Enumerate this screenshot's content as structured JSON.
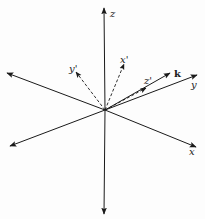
{
  "diagram": {
    "type": "3d-coordinate-axes-rotation",
    "origin": [
      105,
      110
    ],
    "axes": [
      {
        "id": "z",
        "label": "z",
        "end": [
          104,
          8
        ],
        "style": "solid",
        "label_pos": [
          110,
          17
        ]
      },
      {
        "id": "z-neg",
        "label": "",
        "end": [
          104,
          214
        ],
        "style": "solid"
      },
      {
        "id": "y",
        "label": "y",
        "end": [
          197,
          75
        ],
        "style": "solid",
        "label_pos": [
          191,
          88
        ]
      },
      {
        "id": "y-neg",
        "label": "",
        "end": [
          10,
          146
        ],
        "style": "solid"
      },
      {
        "id": "x",
        "label": "x",
        "end": [
          196,
          147
        ],
        "style": "solid",
        "label_pos": [
          189,
          155
        ]
      },
      {
        "id": "x-neg",
        "label": "",
        "end": [
          7,
          73
        ],
        "style": "solid"
      },
      {
        "id": "k",
        "label": "k",
        "end": [
          170,
          73
        ],
        "style": "solid",
        "label_pos": [
          174,
          77
        ]
      },
      {
        "id": "x-prime",
        "label": "x'",
        "end": [
          124,
          64
        ],
        "style": "dashed",
        "label_pos": [
          120,
          63
        ]
      },
      {
        "id": "y-prime",
        "label": "y'",
        "end": [
          76,
          72
        ],
        "style": "dashed",
        "label_pos": [
          69,
          72
        ]
      },
      {
        "id": "z-prime",
        "label": "z'",
        "end": [
          146,
          88
        ],
        "style": "dashed",
        "label_pos": [
          144,
          84
        ]
      }
    ],
    "colors": {
      "line": "#1a1a1a",
      "background": "#fdfdfd"
    }
  }
}
